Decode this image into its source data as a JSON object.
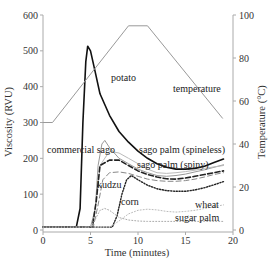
{
  "chart_data": {
    "type": "line",
    "title": "",
    "xlabel": "Time (minutes)",
    "ylabel": "Viscosity (RVU)",
    "y2label": "Temperature (°C)",
    "xlim": [
      0,
      20
    ],
    "ylim": [
      0,
      600
    ],
    "y2lim": [
      0,
      100
    ],
    "xticks": [
      0,
      5,
      10,
      15,
      20
    ],
    "yticks": [
      0,
      100,
      200,
      300,
      400,
      500,
      600
    ],
    "y2ticks": [
      0,
      20,
      40,
      60,
      80,
      100
    ],
    "grid": false,
    "legend": "inline labels",
    "series": [
      {
        "name": "potato",
        "axis": "left",
        "style": "solid-thick",
        "color": "#111111",
        "x": [
          0,
          3.5,
          3.9,
          4.2,
          4.5,
          4.7,
          5.0,
          5.5,
          6.0,
          7.0,
          8.0,
          9.0,
          10.0,
          11.0,
          12.0,
          13.0,
          14.0,
          15.0,
          16.0,
          17.0,
          18.0,
          19.0
        ],
        "y": [
          8,
          8,
          60,
          300,
          470,
          513,
          500,
          440,
          380,
          320,
          275,
          245,
          220,
          200,
          185,
          175,
          170,
          170,
          172,
          178,
          188,
          198
        ]
      },
      {
        "name": "commercial sago",
        "axis": "left",
        "style": "solid-thin",
        "color": "#999999",
        "x": [
          0,
          5.0,
          5.5,
          5.8,
          6.2,
          6.5,
          7.0,
          8.0,
          9.0,
          10.0,
          11.0,
          12.0,
          13.0,
          14.0,
          15.0,
          16.0,
          17.0,
          18.0,
          19.0
        ],
        "y": [
          8,
          8,
          60,
          180,
          240,
          250,
          230,
          200,
          185,
          170,
          160,
          152,
          150,
          152,
          156,
          162,
          168,
          175,
          182
        ]
      },
      {
        "name": "sago palm (spineless)",
        "axis": "left",
        "style": "solid-thin",
        "color": "#bbbbbb",
        "x": [
          0,
          5.2,
          5.6,
          6.0,
          7.0,
          8.0,
          9.0,
          10.0,
          11.0,
          12.0,
          13.0,
          14.0,
          15.0,
          16.0,
          17.0,
          18.0,
          19.0
        ],
        "y": [
          8,
          8,
          80,
          180,
          220,
          215,
          200,
          185,
          170,
          160,
          158,
          160,
          163,
          167,
          172,
          176,
          180
        ]
      },
      {
        "name": "sago palm (spiny)",
        "axis": "left",
        "style": "dashed-thick",
        "color": "#222222",
        "x": [
          0,
          5.2,
          5.6,
          6.0,
          7.0,
          8.0,
          9.0,
          10.0,
          11.0,
          12.0,
          13.0,
          14.0,
          15.0,
          16.0,
          17.0,
          18.0,
          19.0
        ],
        "y": [
          8,
          8,
          80,
          180,
          195,
          195,
          180,
          165,
          155,
          148,
          143,
          142,
          145,
          150,
          155,
          160,
          165
        ]
      },
      {
        "name": "kudzu",
        "axis": "left",
        "style": "dashed-thin",
        "color": "#888888",
        "x": [
          0,
          5.3,
          5.8,
          6.3,
          7.0,
          8.0,
          9.0,
          10.0,
          11.0,
          12.0,
          13.0,
          14.0,
          15.0,
          16.0,
          17.0,
          18.0,
          19.0
        ],
        "y": [
          8,
          8,
          70,
          140,
          160,
          162,
          158,
          150,
          142,
          138,
          136,
          136,
          138,
          142,
          148,
          155,
          160
        ]
      },
      {
        "name": "wheat",
        "axis": "left",
        "style": "dotted-thick",
        "color": "#222222",
        "x": [
          0,
          7.3,
          7.8,
          8.3,
          8.8,
          9.3,
          10.0,
          11.0,
          12.0,
          13.0,
          14.0,
          15.0,
          16.0,
          17.0,
          18.0,
          19.0
        ],
        "y": [
          8,
          8,
          40,
          100,
          140,
          152,
          140,
          125,
          115,
          110,
          108,
          108,
          112,
          118,
          126,
          135
        ]
      },
      {
        "name": "corn",
        "axis": "left",
        "style": "dotted-thin",
        "color": "#aaaaaa",
        "x": [
          0,
          5.0,
          5.5,
          6.0,
          6.5,
          7.0,
          7.5,
          8.0,
          9.0,
          10.0,
          11.0,
          12.0,
          13.0,
          14.0,
          15.0,
          16.0,
          17.0,
          18.0,
          19.0
        ],
        "y": [
          8,
          8,
          30,
          55,
          60,
          55,
          45,
          35,
          28,
          25,
          24,
          24,
          24,
          24,
          24,
          24,
          24,
          24,
          24
        ]
      },
      {
        "name": "sugar palm",
        "axis": "left",
        "style": "dotted-thin",
        "color": "#bbbbbb",
        "x": [
          0,
          7.0,
          8.0,
          9.0,
          10.0,
          11.0,
          12.0,
          13.0,
          14.0,
          15.0,
          16.0,
          17.0,
          18.0,
          19.0
        ],
        "y": [
          8,
          8,
          25,
          45,
          55,
          58,
          56,
          52,
          50,
          52,
          55,
          60,
          65,
          70
        ]
      },
      {
        "name": "temperature",
        "axis": "right",
        "style": "solid-thin",
        "color": "#999999",
        "x": [
          0,
          1.0,
          9.0,
          11.0,
          18.9
        ],
        "y": [
          50,
          50,
          95,
          95,
          52
        ]
      }
    ],
    "annotations": [
      {
        "text": "potato",
        "x": 7.2,
        "y": 440
      },
      {
        "text": "temperature",
        "x": 13.8,
        "y": 62,
        "axis": "right"
      },
      {
        "text": "commercial sago",
        "x": 0.3,
        "y": 222
      },
      {
        "text": "sago palm (spineless)",
        "x": 11.2,
        "y": 222
      },
      {
        "text": "sago palm (spiny)",
        "x": 11.0,
        "y": 180
      },
      {
        "text": "kudzu",
        "x": 6.0,
        "y": 130
      },
      {
        "text": "corn",
        "x": 8.8,
        "y": 85
      },
      {
        "text": "wheat",
        "x": 16.0,
        "y": 72
      },
      {
        "text": "sugar palm",
        "x": 13.6,
        "y": 38
      }
    ]
  },
  "labels": {
    "xlabel": "Time (minutes)",
    "ylabel": "Viscosity (RVU)",
    "y2label": "Temperature (°C)",
    "potato": "potato",
    "temperature": "temperature",
    "commercial_sago": "commercial sago",
    "sago_spineless": "sago palm (spineless)",
    "sago_spiny": "sago palm (spiny)",
    "kudzu": "kudzu",
    "corn": "corn",
    "wheat": "wheat",
    "sugar_palm": "sugar palm"
  }
}
